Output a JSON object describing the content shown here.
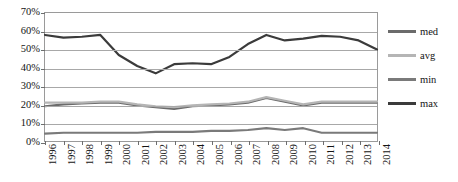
{
  "chart_data": {
    "type": "line",
    "title": "",
    "subtitle": "",
    "xlabel": "",
    "ylabel": "",
    "ylim": [
      0,
      70
    ],
    "ytick_labels": [
      "0%",
      "10%",
      "20%",
      "30%",
      "40%",
      "50%",
      "60%",
      "70%"
    ],
    "ytick_values": [
      0,
      10,
      20,
      30,
      40,
      50,
      60,
      70
    ],
    "grid": true,
    "legend_position": "right",
    "categories": [
      "1996",
      "1997",
      "1998",
      "1999",
      "2000",
      "2001",
      "2002",
      "2003",
      "2004",
      "2005",
      "2006",
      "2007",
      "2008",
      "2009",
      "2010",
      "2011",
      "2012",
      "2013",
      "2014"
    ],
    "series": [
      {
        "name": "med",
        "color": "#6b6b6b",
        "values": [
          19.0,
          20.0,
          20.5,
          21.0,
          21.0,
          19.5,
          18.5,
          17.5,
          19.0,
          19.5,
          20.0,
          21.0,
          23.5,
          21.5,
          19.5,
          21.0,
          21.0,
          21.0,
          21.0
        ]
      },
      {
        "name": "avg",
        "color": "#b5b5b5",
        "values": [
          21.0,
          21.0,
          21.0,
          21.5,
          21.5,
          20.0,
          19.0,
          18.5,
          19.5,
          20.0,
          20.5,
          21.5,
          24.0,
          22.0,
          20.0,
          21.5,
          21.5,
          21.5,
          21.5
        ]
      },
      {
        "name": "min",
        "color": "#7a7a7a",
        "values": [
          4.0,
          4.5,
          4.5,
          4.5,
          4.5,
          4.5,
          5.0,
          5.0,
          5.0,
          5.5,
          5.5,
          6.0,
          7.0,
          6.0,
          7.0,
          4.5,
          4.5,
          4.5,
          4.5
        ]
      },
      {
        "name": "max",
        "color": "#3b3b3b",
        "values": [
          58.0,
          56.5,
          57.0,
          58.0,
          47.0,
          41.0,
          37.0,
          42.0,
          42.5,
          42.0,
          46.0,
          53.0,
          58.0,
          55.0,
          56.0,
          57.5,
          57.0,
          55.0,
          50.0
        ]
      }
    ]
  },
  "legend": {
    "items": [
      {
        "label": "med",
        "color": "#6b6b6b"
      },
      {
        "label": "avg",
        "color": "#b5b5b5"
      },
      {
        "label": "min",
        "color": "#7a7a7a"
      },
      {
        "label": "max",
        "color": "#3b3b3b"
      }
    ]
  }
}
